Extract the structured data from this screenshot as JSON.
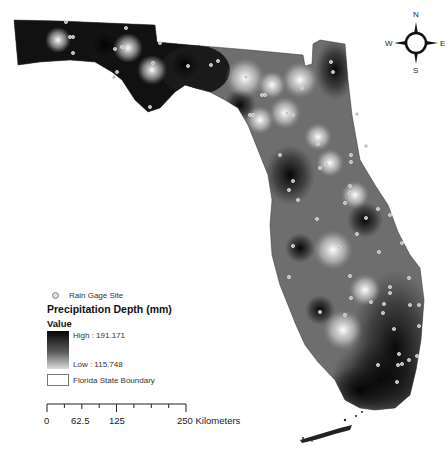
{
  "map": {
    "title": "Precipitation Depth (mm)",
    "type": "interpolated precipitation surface over Florida",
    "colors": {
      "high": "#050505",
      "low": "#e8e8e8",
      "mid": "#7a7a7a",
      "background": "#ffffff",
      "gage_marker": "#c8c8c8"
    }
  },
  "compass": {
    "north": "N",
    "south": "S",
    "east": "E",
    "west": "W"
  },
  "legend": {
    "gage_label": "Rain Gage Site",
    "title": "Precipitation Depth (mm)",
    "value_label": "Value",
    "high_label": "High : 191.171",
    "low_label": "Low : 115.748",
    "boundary_label": "Florida State Boundary"
  },
  "scale": {
    "ticks": [
      "0",
      "62.5",
      "125",
      "250 Kilometers"
    ],
    "unit": "Kilometers"
  }
}
